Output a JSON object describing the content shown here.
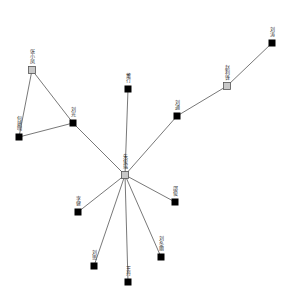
{
  "diagram": {
    "type": "network",
    "background": "#ffffff",
    "edge_color": "#555555",
    "node_colors": {
      "hub": "#c8c8c8",
      "leaf": "#000000"
    },
    "nodes": [
      {
        "id": "n0",
        "label": "朱俊瑞",
        "x": 125,
        "y": 175,
        "kind": "hub"
      },
      {
        "id": "n1",
        "label": "张小凤",
        "x": 32,
        "y": 70,
        "kind": "hub"
      },
      {
        "id": "n2",
        "label": "何建明",
        "x": 19,
        "y": 137,
        "kind": "leaf"
      },
      {
        "id": "n3",
        "label": "刘光",
        "x": 73,
        "y": 123,
        "kind": "leaf"
      },
      {
        "id": "n4",
        "label": "董行",
        "x": 128,
        "y": 89,
        "kind": "leaf"
      },
      {
        "id": "n5",
        "label": "刘通",
        "x": 177,
        "y": 116,
        "kind": "leaf"
      },
      {
        "id": "n6",
        "label": "赵利锋",
        "x": 227,
        "y": 86,
        "kind": "hub"
      },
      {
        "id": "n7",
        "label": "刘涛",
        "x": 272,
        "y": 43,
        "kind": "leaf"
      },
      {
        "id": "n8",
        "label": "李健",
        "x": 78,
        "y": 212,
        "kind": "leaf"
      },
      {
        "id": "n9",
        "label": "刘思",
        "x": 94,
        "y": 266,
        "kind": "leaf"
      },
      {
        "id": "n10",
        "label": "王丹",
        "x": 128,
        "y": 282,
        "kind": "leaf"
      },
      {
        "id": "n11",
        "label": "邵俊",
        "x": 175,
        "y": 202,
        "kind": "leaf"
      },
      {
        "id": "n12",
        "label": "刘冬丽",
        "x": 161,
        "y": 257,
        "kind": "leaf"
      }
    ],
    "edges": [
      [
        "n1",
        "n2"
      ],
      [
        "n1",
        "n3"
      ],
      [
        "n2",
        "n3"
      ],
      [
        "n3",
        "n0"
      ],
      [
        "n4",
        "n0"
      ],
      [
        "n5",
        "n0"
      ],
      [
        "n5",
        "n6"
      ],
      [
        "n6",
        "n7"
      ],
      [
        "n0",
        "n8"
      ],
      [
        "n0",
        "n9"
      ],
      [
        "n0",
        "n10"
      ],
      [
        "n0",
        "n11"
      ],
      [
        "n0",
        "n12"
      ]
    ]
  }
}
